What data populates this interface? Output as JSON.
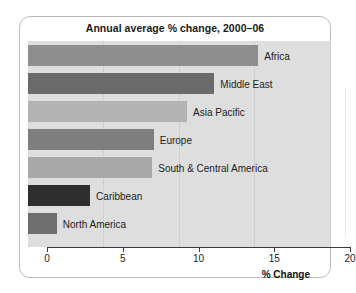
{
  "chart_data": {
    "type": "bar",
    "orientation": "horizontal",
    "title": "Annual average % change, 2000–06",
    "xlabel": "% Change",
    "ylabel": "",
    "xlim": [
      0,
      20
    ],
    "xticks": [
      "0",
      "5",
      "10",
      "15",
      "20"
    ],
    "xtick_values": [
      0,
      5,
      10,
      15,
      20
    ],
    "grid": true,
    "legend": "none",
    "categories": [
      "Africa",
      "Middle East",
      "Asia Pacific",
      "Europe",
      "South & Central America",
      "Caribbean",
      "North America"
    ],
    "values": [
      15.2,
      12.3,
      10.5,
      8.3,
      8.2,
      4.1,
      1.9
    ],
    "bar_colors": [
      "#8e8e8e",
      "#6b6b6b",
      "#b3b3b3",
      "#7e7e7e",
      "#a8a8a8",
      "#2e2e2e",
      "#6e6e6e"
    ],
    "plot_background": "#dedede",
    "axis_color": "#3b3b3b",
    "card_background": "#ffffff"
  },
  "bars": [
    {
      "label": "Africa",
      "value": 15.2,
      "color": "#8e8e8e"
    },
    {
      "label": "Middle East",
      "value": 12.3,
      "color": "#6b6b6b"
    },
    {
      "label": "Asia Pacific",
      "value": 10.5,
      "color": "#b3b3b3"
    },
    {
      "label": "Europe",
      "value": 8.3,
      "color": "#7e7e7e"
    },
    {
      "label": "South & Central America",
      "value": 8.2,
      "color": "#a8a8a8"
    },
    {
      "label": "Caribbean",
      "value": 4.1,
      "color": "#2e2e2e"
    },
    {
      "label": "North America",
      "value": 1.9,
      "color": "#6e6e6e"
    }
  ],
  "axis": {
    "title": "% Change",
    "ticks": [
      "0",
      "5",
      "10",
      "15",
      "20"
    ]
  }
}
